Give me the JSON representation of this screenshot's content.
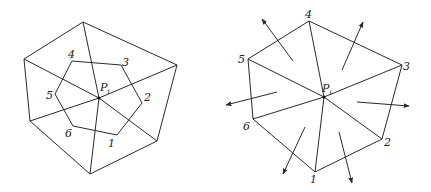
{
  "left_figure": {
    "center_label": "P",
    "center_subscript": "i",
    "center": [
      99,
      98
    ],
    "outer_polygon": [
      [
        83,
        22
      ],
      [
        177,
        65
      ],
      [
        157,
        141
      ],
      [
        90,
        174
      ],
      [
        30,
        121
      ],
      [
        24,
        59
      ]
    ],
    "inner_hexagon": [
      {
        "label": "1",
        "pt": [
          117,
          135
        ],
        "lx": 108,
        "ly": 147
      },
      {
        "label": "2",
        "pt": [
          142,
          103
        ],
        "lx": 144,
        "ly": 101
      },
      {
        "label": "3",
        "pt": [
          121,
          65
        ],
        "lx": 122,
        "ly": 66
      },
      {
        "label": "4",
        "pt": [
          72,
          61
        ],
        "lx": 68,
        "ly": 58
      },
      {
        "label": "5",
        "pt": [
          55,
          94
        ],
        "lx": 46,
        "ly": 99
      },
      {
        "label": "6",
        "pt": [
          73,
          126
        ],
        "lx": 65,
        "ly": 137
      }
    ]
  },
  "right_figure": {
    "center_label": "P",
    "center_subscript": "i",
    "center": [
      324,
      97
    ],
    "vertices": [
      {
        "label": "1",
        "pt": [
          315,
          172
        ],
        "lx": 310,
        "ly": 183
      },
      {
        "label": "2",
        "pt": [
          382,
          139
        ],
        "lx": 384,
        "ly": 146
      },
      {
        "label": "3",
        "pt": [
          402,
          65
        ],
        "lx": 403,
        "ly": 70
      },
      {
        "label": "4",
        "pt": [
          309,
          21
        ],
        "lx": 305,
        "ly": 18
      },
      {
        "label": "5",
        "pt": [
          248,
          59
        ],
        "lx": 238,
        "ly": 63
      },
      {
        "label": "6",
        "pt": [
          253,
          119
        ],
        "lx": 243,
        "ly": 130
      }
    ],
    "arrows": [
      {
        "from": [
          293,
          61
        ],
        "to": [
          262,
          19
        ]
      },
      {
        "from": [
          342,
          70
        ],
        "to": [
          363,
          22
        ]
      },
      {
        "from": [
          277,
          92
        ],
        "to": [
          226,
          105
        ]
      },
      {
        "from": [
          357,
          102
        ],
        "to": [
          409,
          106
        ]
      },
      {
        "from": [
          305,
          127
        ],
        "to": [
          283,
          174
        ]
      },
      {
        "from": [
          339,
          132
        ],
        "to": [
          352,
          183
        ]
      }
    ]
  }
}
